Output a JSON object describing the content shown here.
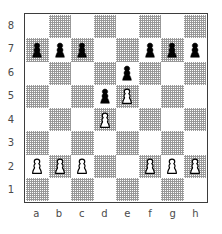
{
  "diagram": {
    "type": "chess-board-diagram",
    "orientation": "white-bottom",
    "board_size": 8,
    "light_square_color": "#ffffff",
    "dark_square_color": "#969696",
    "border_color": "#3d3d3d",
    "label_color": "#4a4a4a",
    "black_piece_color": "#000000",
    "white_piece_fill": "#ffffff",
    "white_piece_outline": "#000000"
  },
  "labels": {
    "files": [
      "a",
      "b",
      "c",
      "d",
      "e",
      "f",
      "g",
      "h"
    ],
    "ranks": [
      "8",
      "7",
      "6",
      "5",
      "4",
      "3",
      "2",
      "1"
    ]
  },
  "position": {
    "fen": "8/ppp2ppp/4p3/3pP3/3P4/8/PPP2PPP/8 w - - 0 1",
    "white_pawns": [
      "a2",
      "b2",
      "c2",
      "d4",
      "e5",
      "f2",
      "g2",
      "h2"
    ],
    "black_pawns": [
      "a7",
      "b7",
      "c7",
      "d5",
      "e6",
      "f7",
      "g7",
      "h7"
    ],
    "piece_count": 16,
    "squares": [
      [
        null,
        null,
        null,
        null,
        null,
        null,
        null,
        null
      ],
      [
        {
          "piece": "pawn",
          "color": "black"
        },
        {
          "piece": "pawn",
          "color": "black"
        },
        {
          "piece": "pawn",
          "color": "black"
        },
        null,
        null,
        {
          "piece": "pawn",
          "color": "black"
        },
        {
          "piece": "pawn",
          "color": "black"
        },
        {
          "piece": "pawn",
          "color": "black"
        }
      ],
      [
        null,
        null,
        null,
        null,
        {
          "piece": "pawn",
          "color": "black"
        },
        null,
        null,
        null
      ],
      [
        null,
        null,
        null,
        {
          "piece": "pawn",
          "color": "black"
        },
        {
          "piece": "pawn",
          "color": "white"
        },
        null,
        null,
        null
      ],
      [
        null,
        null,
        null,
        {
          "piece": "pawn",
          "color": "white"
        },
        null,
        null,
        null,
        null
      ],
      [
        null,
        null,
        null,
        null,
        null,
        null,
        null,
        null
      ],
      [
        {
          "piece": "pawn",
          "color": "white"
        },
        {
          "piece": "pawn",
          "color": "white"
        },
        {
          "piece": "pawn",
          "color": "white"
        },
        null,
        null,
        {
          "piece": "pawn",
          "color": "white"
        },
        {
          "piece": "pawn",
          "color": "white"
        },
        {
          "piece": "pawn",
          "color": "white"
        }
      ],
      [
        null,
        null,
        null,
        null,
        null,
        null,
        null,
        null
      ]
    ]
  }
}
